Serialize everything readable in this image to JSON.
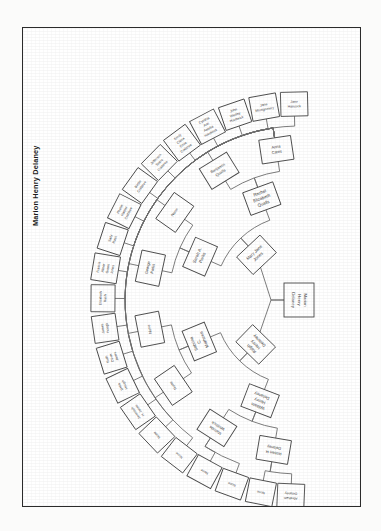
{
  "document": {
    "caption": "Marion Henry Delaney",
    "type": "genealogy-fan-chart",
    "orientation": "landscape-rotated-90",
    "paper_color": "#ffffff",
    "ink_color": "#4a4a4a"
  },
  "chart_data": {
    "type": "fan",
    "title": "Marion Henry Delaney",
    "root": "Marion Henry Delaney",
    "generations": 5,
    "nodes": [
      {
        "id": "g0-0",
        "gen": 0,
        "index": 0,
        "label": "Marion Henry Delaney",
        "parent": null
      },
      {
        "id": "g1-0",
        "gen": 1,
        "index": 0,
        "label": "Ralph Henry Delaney",
        "parent": "g0-0"
      },
      {
        "id": "g1-1",
        "gen": 1,
        "index": 1,
        "label": "Mary Jane Jones",
        "parent": "g0-0"
      },
      {
        "id": "g2-0",
        "gen": 2,
        "index": 0,
        "label": "William Henry Delaney",
        "parent": "g1-0"
      },
      {
        "id": "g2-1",
        "gen": 2,
        "index": 1,
        "label": "Sabrina C. Mathews",
        "parent": "g1-0"
      },
      {
        "id": "g2-2",
        "gen": 2,
        "index": 2,
        "label": "Sarah A. Parks",
        "parent": "g1-1"
      },
      {
        "id": "g2-3",
        "gen": 2,
        "index": 3,
        "label": "Rachel Elizabeth Qualls",
        "parent": "g1-1"
      },
      {
        "id": "g3-0",
        "gen": 3,
        "index": 0,
        "label": "Robert H. Delaney",
        "parent": "g2-0"
      },
      {
        "id": "g3-1",
        "gen": 3,
        "index": 1,
        "label": "Malinda Whitlock",
        "parent": "g2-0"
      },
      {
        "id": "g3-2",
        "gen": 3,
        "index": 2,
        "label": "None",
        "parent": "g2-1"
      },
      {
        "id": "g3-3",
        "gen": 3,
        "index": 3,
        "label": "None",
        "parent": "g2-1"
      },
      {
        "id": "g3-4",
        "gen": 3,
        "index": 4,
        "label": "George Parks",
        "parent": "g2-2"
      },
      {
        "id": "g3-5",
        "gen": 3,
        "index": 5,
        "label": "None",
        "parent": "g2-2"
      },
      {
        "id": "g3-6",
        "gen": 3,
        "index": 6,
        "label": "Benjamin Qualls",
        "parent": "g2-3"
      },
      {
        "id": "g3-7",
        "gen": 3,
        "index": 7,
        "label": "Anna Cates",
        "parent": "g2-3"
      },
      {
        "id": "g4-0",
        "gen": 4,
        "index": 0,
        "label": "Abraham Delaney",
        "parent": "g3-0"
      },
      {
        "id": "g4-1",
        "gen": 4,
        "index": 1,
        "label": "None",
        "parent": "g3-0"
      },
      {
        "id": "g4-2",
        "gen": 4,
        "index": 2,
        "label": "None",
        "parent": "g3-1"
      },
      {
        "id": "g4-3",
        "gen": 4,
        "index": 3,
        "label": "None",
        "parent": "g3-1"
      },
      {
        "id": "g4-4",
        "gen": 4,
        "index": 4,
        "label": "None",
        "parent": "g3-2"
      },
      {
        "id": "g4-5",
        "gen": 4,
        "index": 5,
        "label": "None",
        "parent": "g3-3"
      },
      {
        "id": "g4-6",
        "gen": 4,
        "index": 6,
        "label": "Jeremiah H. Jones",
        "parent": "g3-4"
      },
      {
        "id": "g4-7",
        "gen": 4,
        "index": 7,
        "label": "Delia Hough",
        "parent": "g3-5"
      },
      {
        "id": "g4-8",
        "gen": 4,
        "index": 8,
        "label": "Ruth Oliver Jones",
        "parent": "g3-6"
      },
      {
        "id": "g4-9",
        "gen": 4,
        "index": 9,
        "label": "James Hough",
        "parent": "g3-7"
      },
      {
        "id": "g4-10",
        "gen": 4,
        "index": 10,
        "label": "Elizabeth Rush",
        "parent": "g3-7"
      },
      {
        "id": "g4-11",
        "gen": 4,
        "index": 11,
        "label": "Francis Abner Green Jones",
        "parent": "g3-7"
      },
      {
        "id": "g4-12",
        "gen": 4,
        "index": 12,
        "label": "Sally Rush",
        "parent": "g3-7"
      },
      {
        "id": "g4-13",
        "gen": 4,
        "index": 13,
        "label": "Phebe Harper Crabtree",
        "parent": "g3-7"
      },
      {
        "id": "g4-14",
        "gen": 4,
        "index": 14,
        "label": "Bettie Crabtree",
        "parent": "g3-7"
      },
      {
        "id": "g4-15",
        "gen": 4,
        "index": 15,
        "label": "Jefferson Sears Crabtree",
        "parent": "g3-7"
      },
      {
        "id": "g4-16",
        "gen": 4,
        "index": 16,
        "label": "Emily Cletia Olive Crabtree",
        "parent": "g3-7"
      },
      {
        "id": "g4-17",
        "gen": 4,
        "index": 17,
        "label": "Cynthia Ann Amelia Hardwick",
        "parent": "g3-7"
      },
      {
        "id": "g4-18",
        "gen": 4,
        "index": 18,
        "label": "John Wesley Hardwick",
        "parent": "g3-7"
      },
      {
        "id": "g4-19",
        "gen": 4,
        "index": 19,
        "label": "Jane Montgomery",
        "parent": "g3-7"
      },
      {
        "id": "g4-20",
        "gen": 4,
        "index": 20,
        "label": "Jane Hancock",
        "parent": "g3-7"
      }
    ],
    "inner_ring_labels": [
      "Ralph Henry Delaney",
      "Mary Jane Jones"
    ],
    "legend": [],
    "grid": false
  }
}
